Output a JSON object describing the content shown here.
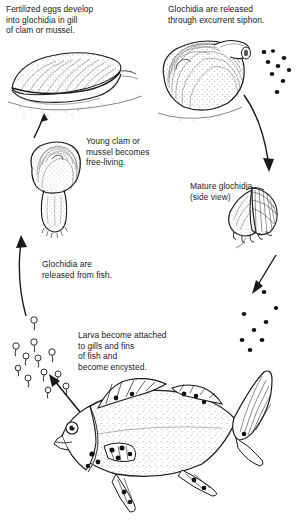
{
  "diagram": {
    "background_color": "#ffffff",
    "ink_color": "#1a1a1a"
  },
  "labels": {
    "fertilized_eggs": "Fertilized eggs develop\ninto glochidia in gill\nof clam or mussel.",
    "excurrent_siphon": "Glochidia are released\nthrough excurrent siphon.",
    "young_clam": "Young clam or\nmussel becomes\nfree-living.",
    "mature_glochidia": "Mature glochidia\n(side view)",
    "released_from_fish": "Glochidia are\nreleased from fish.",
    "larva_attached": "Larva become attached\nto gills and fins\nof fish and\nbecome encysted."
  },
  "illustrations": {
    "adult_clam": "adult-clam-side-view",
    "siphon_clam": "clam-releasing-glochidia",
    "young_clam": "juvenile-clam-with-foot",
    "mature_glochidium": "glochidium-side-view",
    "fish": "host-fish-with-encysted-glochidia",
    "larvae_swarm": "free-swimming-glochidia-larvae"
  },
  "arrows": {
    "up_left": "arrow-young-clam-to-adult-clam",
    "right_down": "arrow-siphon-to-mature-glochidium",
    "down_left": "arrow-glochidium-to-fish",
    "long_up": "arrow-larvae-to-young-clam",
    "larva_to_fish": "arrow-larvae-release-from-fish"
  }
}
